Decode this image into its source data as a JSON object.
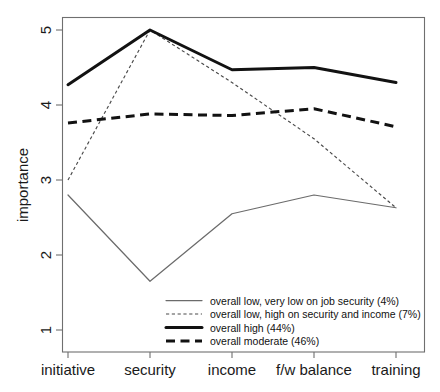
{
  "chart_data": {
    "type": "line",
    "title": "",
    "subtitle": "",
    "xlabel": "",
    "ylabel": "importance",
    "categories": [
      "initiative",
      "security",
      "income",
      "f/w balance",
      "training"
    ],
    "ylim": [
      1,
      5.2
    ],
    "yticks": [
      1,
      2,
      3,
      4,
      5
    ],
    "ytick_labels": [
      "1",
      "2",
      "3",
      "4",
      "5"
    ],
    "grid": false,
    "legend_position": "bottom-right",
    "series": [
      {
        "name": "overall low, very low on job security (4%)",
        "style": "thin-solid",
        "color": "#6b6b6b",
        "values": [
          2.8,
          1.65,
          2.55,
          2.8,
          2.63
        ]
      },
      {
        "name": "overall low, high on security and income (7%)",
        "style": "dotted",
        "color": "#4a4a4a",
        "values": [
          3.0,
          5.0,
          4.3,
          3.55,
          2.63
        ]
      },
      {
        "name": "overall high (44%)",
        "style": "thick-solid",
        "color": "#121212",
        "values": [
          4.27,
          5.0,
          4.47,
          4.5,
          4.3
        ]
      },
      {
        "name": "overall moderate (46%)",
        "style": "thick-dashed",
        "color": "#121212",
        "values": [
          3.76,
          3.88,
          3.86,
          3.95,
          3.71
        ]
      }
    ]
  },
  "axis": {
    "y_title": "importance",
    "y_tick_1": "1",
    "y_tick_2": "2",
    "y_tick_3": "3",
    "y_tick_4": "4",
    "y_tick_5": "5",
    "x_tick_1": "initiative",
    "x_tick_2": "security",
    "x_tick_3": "income",
    "x_tick_4": "f/w balance",
    "x_tick_5": "training"
  },
  "legend": {
    "entries": [
      {
        "label": "overall low, very low on job security (4%)"
      },
      {
        "label": "overall low, high on security and income (7%)"
      },
      {
        "label": "overall high (44%)"
      },
      {
        "label": "overall moderate (46%)"
      }
    ]
  }
}
